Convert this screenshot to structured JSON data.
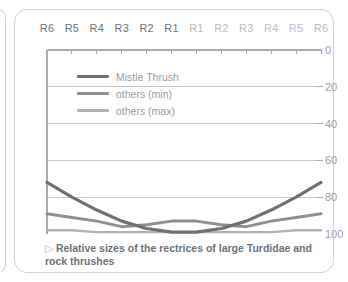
{
  "caption": {
    "marker": "▷",
    "text": "Relative sizes of the rectrices of large Turdidae and rock thrushes"
  },
  "legend": {
    "position": "inside-top-left",
    "items": [
      {
        "label": "Mistle Thrush",
        "color": "#6e7276",
        "width": 3.2
      },
      {
        "label": "others (min)",
        "color": "#8d9194",
        "width": 3.0
      },
      {
        "label": "others (max)",
        "color": "#b0b4b7",
        "width": 2.4
      }
    ]
  },
  "colors": {
    "axis": "#a9adb0",
    "grid": "#c6cacd",
    "tick_label_left": "#6f7478",
    "tick_label_right": "#b9bdc0",
    "value_label": "#9a9ea1",
    "card_border": "#cfd3d6",
    "caption_text": "#6d7276",
    "background": "#ffffff"
  },
  "chart_data": {
    "type": "line",
    "title": "",
    "subtitle": "",
    "xlabel": "",
    "ylabel": "",
    "grid": true,
    "legend_position": "inside-top-left",
    "y_axis_side": "right",
    "y_inverted": true,
    "ylim": [
      0,
      100
    ],
    "yticks": [
      0,
      20,
      40,
      60,
      80,
      100
    ],
    "ytick_labels": [
      "0",
      "20",
      "40",
      "60",
      "80",
      "100"
    ],
    "categories": [
      "R6",
      "R5",
      "R4",
      "R3",
      "R2",
      "R1",
      "R1",
      "R2",
      "R3",
      "R4",
      "R5",
      "R6"
    ],
    "category_sides": [
      "left",
      "left",
      "left",
      "left",
      "left",
      "left",
      "right",
      "right",
      "right",
      "right",
      "right",
      "right"
    ],
    "series": [
      {
        "name": "Mistle Thrush",
        "color": "#6e7276",
        "values": [
          72,
          80,
          87,
          93,
          97,
          99,
          99,
          97,
          93,
          87,
          80,
          72
        ]
      },
      {
        "name": "others (min)",
        "color": "#8d9194",
        "values": [
          89,
          91,
          93,
          96,
          95,
          93,
          93,
          95,
          96,
          93,
          91,
          89
        ]
      },
      {
        "name": "others (max)",
        "color": "#b0b4b7",
        "values": [
          98,
          98,
          99,
          99,
          99,
          99,
          99,
          99,
          99,
          99,
          98,
          98
        ]
      }
    ]
  }
}
